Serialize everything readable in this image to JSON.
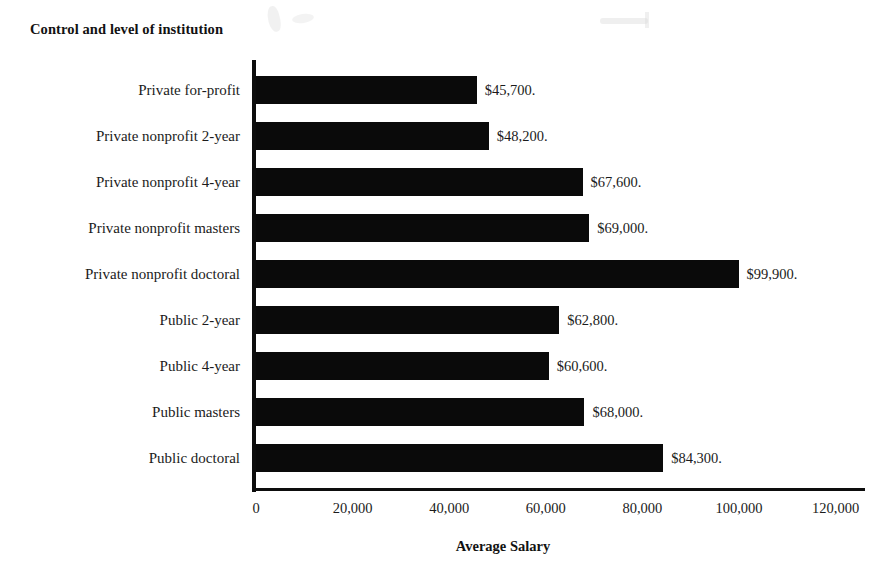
{
  "chart_data": {
    "type": "bar",
    "orientation": "horizontal",
    "title": "Control and level of institution",
    "xlabel": "Average Salary",
    "ylabel": "",
    "categories": [
      "Private for-profit",
      "Private nonprofit 2-year",
      "Private nonprofit 4-year",
      "Private nonprofit masters",
      "Private nonprofit doctoral",
      "Public 2-year",
      "Public 4-year",
      "Public masters",
      "Public doctoral"
    ],
    "values": [
      45700,
      48200,
      67600,
      69000,
      99900,
      62800,
      60600,
      68000,
      84300
    ],
    "data_labels": [
      "$45,700.",
      "$48,200.",
      "$67,600.",
      "$69,000.",
      "$99,900.",
      "$62,800.",
      "$60,600.",
      "$68,000.",
      "$84,300."
    ],
    "xlim": [
      0,
      128000
    ],
    "xticks": [
      0,
      20000,
      40000,
      60000,
      80000,
      100000,
      120000
    ],
    "xtick_labels": [
      "0",
      "20,000",
      "40,000",
      "60,000",
      "80,000",
      "100,000",
      "120,000"
    ],
    "grid": false,
    "legend": false,
    "bar_color": "#0a0a0a",
    "background_color": "#ffffff"
  }
}
